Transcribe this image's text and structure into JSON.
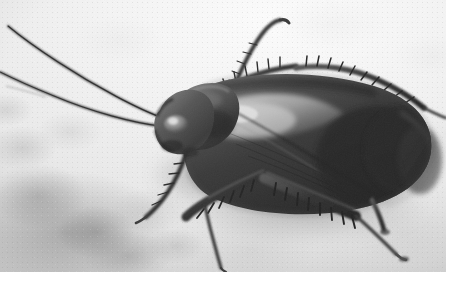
{
  "image": {
    "kind": "photograph",
    "subject": "cockroach",
    "subject_common_name": "American cockroach",
    "view": "dorsal macro close-up",
    "color_mode": "grayscale",
    "orientation": "head at left, abdomen at right",
    "surface": "mottled light gray concrete / stone",
    "canvas": {
      "width": 475,
      "height": 288
    },
    "photo_area": {
      "x": 0,
      "y": 0,
      "width": 446,
      "height": 272
    },
    "margins": {
      "right": "white",
      "bottom": "white"
    },
    "alt_text": "Black-and-white close-up photograph of a cockroach on a pale mottled concrete surface, its two long antennae sweeping to the upper left and six spiny legs splayed out."
  },
  "palette": {
    "background_light": "#f2f2f2",
    "background_mid": "#d8d8d8",
    "background_dark": "#a8a8a8",
    "body_dark": "#2c2c2c",
    "body_mid": "#4a4a4a",
    "body_light": "#8e8e8e",
    "wing_highlight": "#cfcfcf",
    "leg_dark": "#323232",
    "antenna": "#3a3a3a",
    "margin_white": "#ffffff"
  },
  "anatomy": {
    "parts": [
      {
        "name": "antenna-left-upper",
        "label": "Antenna (upper)",
        "description": "Long thin filament sweeping from head to the upper-left corner of the frame"
      },
      {
        "name": "antenna-left-lower",
        "label": "Antenna (lower)",
        "description": "Second filament running to the left edge of the frame"
      },
      {
        "name": "head",
        "label": "Head",
        "description": "Rounded dark capsule at the left end with a pale compound-eye highlight"
      },
      {
        "name": "pronotum",
        "label": "Pronotum",
        "description": "Shield-shaped plate behind the head"
      },
      {
        "name": "tegmina",
        "label": "Wings / tegmina",
        "description": "Large overlapping leathery forewings covering the abdomen, with a bright specular highlight along the upper-left"
      },
      {
        "name": "abdomen",
        "label": "Abdomen",
        "description": "Broad rounded rear end at the right of the frame"
      },
      {
        "name": "leg-front-left",
        "label": "Front leg",
        "description": "Spiny leg angling down-left below the head"
      },
      {
        "name": "leg-mid-lower",
        "label": "Middle leg",
        "description": "Heavily spined femur and tibia pointing down-left"
      },
      {
        "name": "leg-hind-lower",
        "label": "Hind leg",
        "description": "Long spined leg extending to the lower right with a slender tarsus"
      },
      {
        "name": "leg-upper-front",
        "label": "Upper front leg",
        "description": "Leg raised above the pronotum reaching toward the top of the frame"
      },
      {
        "name": "leg-upper-mid",
        "label": "Upper middle leg",
        "description": "Spined leg along the top edge of the wings"
      },
      {
        "name": "leg-upper-hind",
        "label": "Upper hind leg",
        "description": "Leg extending to the right past the wing margin"
      }
    ],
    "counts": {
      "antennae": 2,
      "legs": 6,
      "visible_spines": "numerous"
    }
  }
}
